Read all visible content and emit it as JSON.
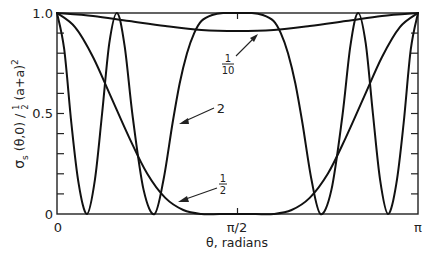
{
  "chart_data": {
    "type": "line",
    "title": "",
    "xlabel": "θ, radians",
    "ylabel": "σs (θ,0) / ½ (a+a)²",
    "xlim": [
      0,
      3.14159
    ],
    "ylim": [
      0,
      1.0
    ],
    "grid": false,
    "legend": "none (curves labeled inline with arrows)",
    "x_tick_labels": [
      "0",
      "π/2",
      "π"
    ],
    "y_tick_labels": [
      "0",
      "0.5",
      "1.0"
    ],
    "x_units": "fraction of π",
    "series": [
      {
        "name": "2",
        "label": "2",
        "x_over_pi": [
          0,
          0.02,
          0.04,
          0.06,
          0.083,
          0.105,
          0.125,
          0.145,
          0.166,
          0.187,
          0.21,
          0.24,
          0.27,
          0.295,
          0.32,
          0.34,
          0.36,
          0.38,
          0.4,
          0.43,
          0.46,
          0.5,
          0.54,
          0.57,
          0.6,
          0.62,
          0.64,
          0.66,
          0.68,
          0.705,
          0.73,
          0.76,
          0.79,
          0.813,
          0.834,
          0.855,
          0.875,
          0.895,
          0.917,
          0.94,
          0.96,
          0.98,
          1.0
        ],
        "values": [
          1.0,
          0.82,
          0.45,
          0.15,
          0.0,
          0.17,
          0.5,
          0.85,
          1.0,
          0.84,
          0.48,
          0.12,
          0.0,
          0.17,
          0.45,
          0.65,
          0.8,
          0.9,
          0.96,
          0.99,
          1.0,
          1.0,
          1.0,
          0.99,
          0.96,
          0.9,
          0.8,
          0.65,
          0.45,
          0.17,
          0.0,
          0.12,
          0.48,
          0.84,
          1.0,
          0.85,
          0.5,
          0.17,
          0.0,
          0.15,
          0.45,
          0.82,
          1.0
        ]
      },
      {
        "name": "1/2",
        "label": "½",
        "x_over_pi": [
          0,
          0.05,
          0.1,
          0.15,
          0.2,
          0.25,
          0.3,
          0.35,
          0.4,
          0.45,
          0.5,
          0.55,
          0.6,
          0.65,
          0.7,
          0.75,
          0.8,
          0.85,
          0.9,
          0.95,
          1.0
        ],
        "values": [
          1.0,
          0.93,
          0.78,
          0.58,
          0.38,
          0.2,
          0.08,
          0.02,
          0.0,
          0.0,
          0.0,
          0.0,
          0.0,
          0.02,
          0.08,
          0.2,
          0.38,
          0.58,
          0.78,
          0.93,
          1.0
        ]
      },
      {
        "name": "1/10",
        "label": "1/10",
        "x_over_pi": [
          0,
          0.1,
          0.2,
          0.3,
          0.4,
          0.5,
          0.6,
          0.7,
          0.8,
          0.9,
          1.0
        ],
        "values": [
          1.0,
          0.985,
          0.96,
          0.935,
          0.915,
          0.91,
          0.915,
          0.935,
          0.96,
          0.985,
          1.0
        ]
      }
    ],
    "annotations": [
      {
        "text": "1/10",
        "points_to": "1/10 curve near π/2, value ≈ 0.91"
      },
      {
        "text": "2",
        "points_to": "rising flank of plateau curve near θ ≈ 0.38π"
      },
      {
        "text": "1/2",
        "points_to": "1/2 curve near θ ≈ 0.33π"
      }
    ]
  },
  "axes": {
    "x_ticks": {
      "zero": "0",
      "half_pi": "π/2",
      "pi": "π"
    },
    "y_ticks": {
      "zero": "0",
      "half": "0.5",
      "one": "1.0"
    },
    "xlabel": "θ, radians",
    "ylabel_main": "σ",
    "ylabel_sub": "s",
    "ylabel_rest": " (θ,0) / ",
    "ylabel_frac_num": "1",
    "ylabel_frac_den": "2",
    "ylabel_tail": " (a+a)",
    "ylabel_sup": "2"
  },
  "labels": {
    "tenth_num": "1",
    "tenth_den": "10",
    "two": "2",
    "half_num": "1",
    "half_den": "2"
  },
  "style": {
    "line_color": "#111111",
    "frame_color": "#222222"
  }
}
